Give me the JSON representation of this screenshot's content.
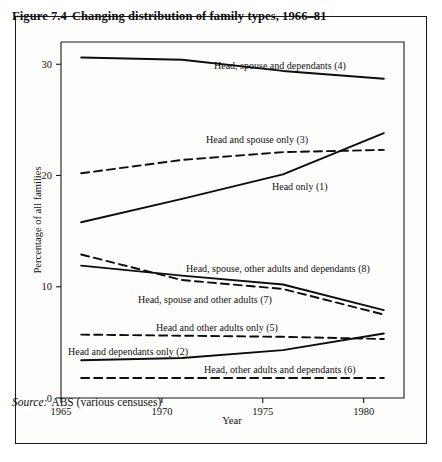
{
  "figure": {
    "number": "Figure 7.4",
    "caption": "Changing distribution of family types, 1966–81",
    "source_label": "Source:",
    "source_text": "ABS (various censuses)"
  },
  "chart_data": {
    "type": "line",
    "title": "Changing distribution of family types, 1966–81",
    "xlabel": "Year",
    "ylabel": "Percentage of all families",
    "xlim": [
      1965,
      1982
    ],
    "ylim": [
      0,
      32
    ],
    "xticks": [
      1965,
      1970,
      1975,
      1980
    ],
    "yticks": [
      0,
      10,
      20,
      30
    ],
    "xtick_labels": [
      "1965",
      "1970",
      "1975",
      "1980"
    ],
    "ytick_labels": [
      "0",
      "10",
      "20",
      "30"
    ],
    "grid": false,
    "legend": "inline-labels",
    "x": [
      1966,
      1971,
      1976,
      1981
    ],
    "series": [
      {
        "name": "Head, spouse and dependants (4)",
        "key": "4",
        "style": "solid",
        "values": [
          30.6,
          30.4,
          29.4,
          28.7
        ],
        "label": "Head, spouse and dependants (4)"
      },
      {
        "name": "Head and spouse only (3)",
        "key": "3",
        "style": "dashed",
        "values": [
          20.2,
          21.4,
          22.1,
          22.3
        ],
        "label": "Head and spouse only (3)"
      },
      {
        "name": "Head only (1)",
        "key": "1",
        "style": "solid",
        "values": [
          15.8,
          17.9,
          20.1,
          23.8
        ],
        "label": "Head only (1)"
      },
      {
        "name": "Head, spouse, other adults and dependants (8)",
        "key": "8",
        "style": "solid",
        "values": [
          11.9,
          11.0,
          10.2,
          7.9
        ],
        "label": "Head, spouse, other adults and dependants (8)"
      },
      {
        "name": "Head, spouse and other adults (7)",
        "key": "7",
        "style": "dashed",
        "values": [
          12.9,
          10.6,
          9.8,
          7.5
        ],
        "label": "Head, spouse and other adults (7)"
      },
      {
        "name": "Head and other adults only (5)",
        "key": "5",
        "style": "dashed",
        "values": [
          5.7,
          5.6,
          5.5,
          5.3
        ],
        "label": "Head and other adults only (5)"
      },
      {
        "name": "Head and dependants only (2)",
        "key": "2",
        "style": "solid",
        "values": [
          3.4,
          3.6,
          4.3,
          5.8
        ],
        "label": "Head and dependants only (2)"
      },
      {
        "name": "Head, other adults and dependants (6)",
        "key": "6",
        "style": "dashed",
        "values": [
          1.8,
          1.8,
          1.8,
          1.8
        ],
        "label": "Head, other adults and dependants (6)"
      }
    ],
    "inline_label_positions": [
      {
        "key": "4",
        "x": 214,
        "y": 69
      },
      {
        "key": "3",
        "x": 206,
        "y": 143
      },
      {
        "key": "1",
        "x": 272,
        "y": 190
      },
      {
        "key": "8",
        "x": 186,
        "y": 272
      },
      {
        "key": "7",
        "x": 138,
        "y": 303
      },
      {
        "key": "5",
        "x": 156,
        "y": 331
      },
      {
        "key": "2",
        "x": 68,
        "y": 355
      },
      {
        "key": "6",
        "x": 204,
        "y": 373
      }
    ]
  }
}
